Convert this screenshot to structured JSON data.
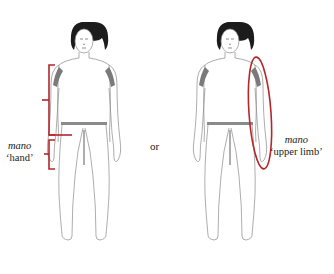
{
  "diagram": {
    "left_panel": {
      "term": "mano",
      "gloss": "‘hand’",
      "annotation": "bracket marking the hand segment below the forearm"
    },
    "connector": "or",
    "right_panel": {
      "term": "mano",
      "gloss": "‘upper limb’",
      "annotation": "ellipse enclosing the whole arm"
    },
    "colors": {
      "annotation": "#b5262a",
      "outline": "#8a8a8a",
      "shading": "#7a7a7a",
      "hair": "#1c1c1c"
    }
  }
}
